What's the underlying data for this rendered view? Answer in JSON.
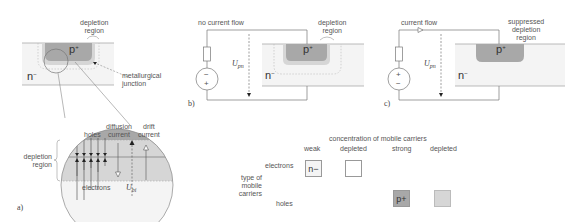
{
  "figure_a": {
    "panel_label": "a)",
    "depletion_region_label": "depletion\nregion",
    "p_plus": "p",
    "p_plus_sup": "+",
    "n_minus": "n",
    "n_minus_sup": "−",
    "junction_label": "metallurgical\njunction",
    "zoom": {
      "holes": "holes",
      "diffusion_current": "diffusion\ncurrent",
      "drift_current": "drift\ncurrent",
      "electrons": "electrons",
      "voltage": "U",
      "voltage_sub": "bi"
    },
    "side_label": "depletion\nregion"
  },
  "figure_b": {
    "panel_label": "b)",
    "title": "no current flow",
    "depletion_region_label": "depletion\nregion",
    "p_plus": "p",
    "p_plus_sup": "+",
    "n_minus": "n",
    "n_minus_sup": "−",
    "voltage": "U",
    "voltage_sub": "pn",
    "source_top": "−",
    "source_bottom": "+"
  },
  "figure_c": {
    "panel_label": "c)",
    "title": "current flow",
    "depletion_region_label": "suppressed\ndepletion\nregion",
    "p_plus": "p",
    "p_plus_sup": "+",
    "n_minus": "n",
    "n_minus_sup": "−",
    "voltage": "U",
    "voltage_sub": "pn",
    "source_top": "+",
    "source_bottom": "−"
  },
  "legend": {
    "title": "concentration of mobile carriers",
    "columns": [
      "weak",
      "depleted",
      "strong",
      "depleted"
    ],
    "row_header": "type of\nmobile\ncarriers",
    "rows": [
      "electrons",
      "holes"
    ],
    "cells": {
      "electrons_weak": "n−",
      "holes_strong": "p+"
    }
  },
  "colors": {
    "p_region": "#a8a8a8",
    "depletion": "#d6d6d6",
    "n_region": "#f4f4f4",
    "line": "#888888"
  }
}
